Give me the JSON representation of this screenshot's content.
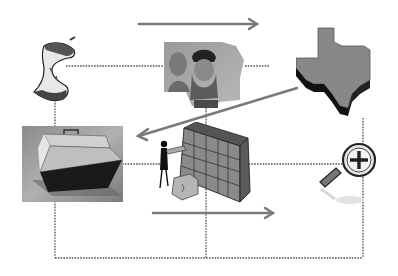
{
  "diagram": {
    "background": "#ffffff",
    "line_color": "#555555",
    "arrow_color": "#7a7a7a",
    "nodes": [
      {
        "id": "apple-core",
        "icon": "apple-core-icon"
      },
      {
        "id": "leonardo-painting",
        "icon": "leonardo-portrait-image"
      },
      {
        "id": "texas",
        "icon": "texas-map-icon"
      },
      {
        "id": "briefcase",
        "icon": "briefcase-photo"
      },
      {
        "id": "filing-cabinet",
        "icon": "person-filing-cabinet-icon"
      },
      {
        "id": "magnifier",
        "icon": "zoom-in-magnifier-icon"
      }
    ],
    "arrows": [
      {
        "from": "left",
        "to": "right",
        "position": "top"
      },
      {
        "from": "texas",
        "to": "briefcase",
        "direction": "down-left"
      },
      {
        "from": "left",
        "to": "right",
        "position": "bottom"
      }
    ]
  }
}
